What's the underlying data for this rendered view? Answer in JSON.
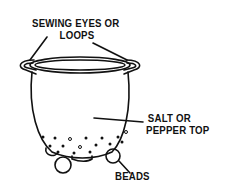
{
  "diagram": {
    "type": "labeled-illustration",
    "labels": {
      "eyes_line1": "SEWING EYES OR",
      "eyes_line2": "LOOPS",
      "top_line1": "SALT OR",
      "top_line2": "PEPPER TOP",
      "beads": "BEADS"
    },
    "colors": {
      "ink": "#111111",
      "background": "#ffffff"
    }
  }
}
